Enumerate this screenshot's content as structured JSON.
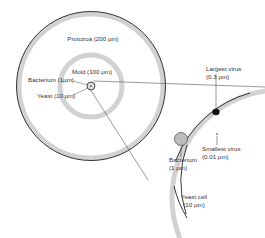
{
  "diagram": {
    "colors": {
      "outline": "#222222",
      "wall_fill": "#cfcfcf",
      "cell_fill": "#bdbdbd",
      "virus_fill": "#111111",
      "leader_line": "#555555"
    },
    "left_panel": {
      "protozoa": {
        "name": "Protozoa",
        "size": "(200 µm)",
        "label": "Protozoa (200 µm)"
      },
      "mold": {
        "name": "Mold",
        "size": "(100 µm)",
        "label": "Mold (100 µm)"
      },
      "bacterium": {
        "name": "Bacterium",
        "size": "(1µm)",
        "label": "Bacterium (1µm)"
      },
      "yeast": {
        "name": "Yeast",
        "size": "(10 µm)",
        "label": "Yeast (10 µm)"
      }
    },
    "right_panel": {
      "largest_virus": {
        "line1": "Largest virus",
        "line2": "(0.3 µm)"
      },
      "smallest_virus": {
        "line1": "Smallest virus",
        "line2": "(0.01 µm)"
      },
      "bacterium": {
        "line1": "Bacterium",
        "line2": "(1 µm)"
      },
      "yeast_cell": {
        "line1": "Yeast cell",
        "line2": "(10 µm)"
      }
    }
  }
}
